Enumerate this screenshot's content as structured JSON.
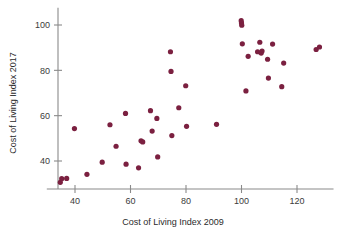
{
  "chart_data": {
    "type": "scatter",
    "title": "",
    "xlabel": "Cost of Living Index 2009",
    "ylabel": "Cost of Living Index 2017",
    "xlim": [
      32,
      131
    ],
    "ylim": [
      28,
      105
    ],
    "xticks": [
      40,
      60,
      80,
      100,
      120
    ],
    "yticks": [
      40,
      60,
      80,
      100
    ],
    "xtick_labels": [
      "40",
      "60",
      "80",
      "100",
      "120"
    ],
    "ytick_labels": [
      "40",
      "60",
      "80",
      "100"
    ],
    "grid": false,
    "legend": false,
    "marker_color": "#7b2040",
    "marker_size": 2.6,
    "axis_color": "#8a8a8a",
    "points": [
      [
        34.7,
        30.6
      ],
      [
        35.2,
        32.2
      ],
      [
        37.0,
        32.3
      ],
      [
        39.8,
        54.3
      ],
      [
        44.3,
        34.1
      ],
      [
        49.8,
        39.5
      ],
      [
        52.6,
        56.0
      ],
      [
        54.8,
        46.5
      ],
      [
        58.2,
        61.0
      ],
      [
        58.4,
        38.6
      ],
      [
        62.9,
        37.0
      ],
      [
        63.8,
        48.9
      ],
      [
        64.4,
        48.4
      ],
      [
        67.2,
        62.2
      ],
      [
        67.8,
        53.2
      ],
      [
        69.5,
        58.8
      ],
      [
        69.8,
        41.8
      ],
      [
        74.4,
        88.2
      ],
      [
        74.6,
        79.5
      ],
      [
        74.9,
        51.2
      ],
      [
        77.4,
        63.5
      ],
      [
        79.9,
        73.2
      ],
      [
        80.2,
        55.3
      ],
      [
        91.0,
        56.2
      ],
      [
        99.9,
        101.9
      ],
      [
        100.0,
        100.9
      ],
      [
        100.1,
        99.9
      ],
      [
        100.3,
        91.7
      ],
      [
        101.6,
        70.9
      ],
      [
        102.4,
        86.2
      ],
      [
        105.8,
        88.2
      ],
      [
        106.6,
        92.4
      ],
      [
        107.1,
        87.6
      ],
      [
        107.4,
        88.5
      ],
      [
        109.4,
        84.9
      ],
      [
        109.7,
        76.6
      ],
      [
        111.2,
        91.6
      ],
      [
        114.5,
        72.8
      ],
      [
        115.2,
        83.2
      ],
      [
        126.9,
        89.2
      ],
      [
        128.1,
        90.3
      ]
    ]
  }
}
